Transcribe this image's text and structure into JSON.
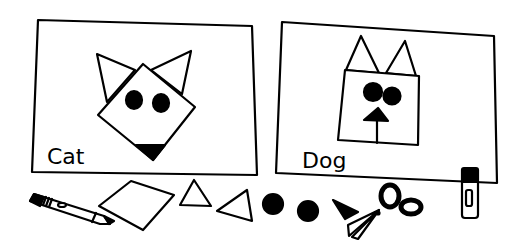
{
  "panels": [
    {
      "label": "Cat",
      "face_shape": "diamond",
      "ears": "triangles",
      "eyes": 2,
      "nose": "triangle"
    },
    {
      "label": "Dog",
      "face_shape": "square",
      "ears": "triangles",
      "eyes": 2,
      "nose": "triangle-with-line"
    }
  ],
  "supplies": [
    {
      "name": "crayon"
    },
    {
      "name": "paper-square"
    },
    {
      "name": "triangle"
    },
    {
      "name": "triangle"
    },
    {
      "name": "circle"
    },
    {
      "name": "circle"
    },
    {
      "name": "small-triangle"
    },
    {
      "name": "scissors"
    },
    {
      "name": "glue-stick"
    }
  ],
  "colors": {
    "ink": "#000000",
    "paper": "#ffffff"
  }
}
